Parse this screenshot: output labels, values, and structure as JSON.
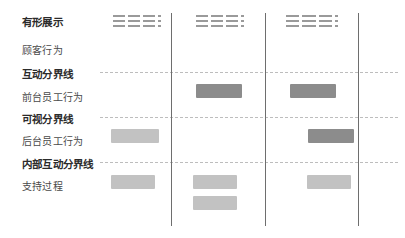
{
  "diagram": {
    "rows": [
      {
        "id": "physical-evidence",
        "label": "有形展示",
        "type": "stage",
        "top": 14
      },
      {
        "id": "customer-action",
        "label": "顾客行为",
        "type": "actor",
        "top": 42
      },
      {
        "id": "interaction-line",
        "label": "互动分界线",
        "type": "stage",
        "top": 66
      },
      {
        "id": "onstage-action",
        "label": "前台员工行为",
        "type": "actor",
        "top": 89
      },
      {
        "id": "visibility-line",
        "label": "可视分界线",
        "type": "stage",
        "top": 111
      },
      {
        "id": "backstage-action",
        "label": "后台员工行为",
        "type": "actor",
        "top": 133
      },
      {
        "id": "internal-line",
        "label": "内部互动分界线",
        "type": "stage",
        "top": 156
      },
      {
        "id": "support-process",
        "label": "支持过程",
        "type": "actor",
        "top": 178
      }
    ],
    "separators": [
      {
        "id": "interaction-divider",
        "y": 72
      },
      {
        "id": "visibility-divider",
        "y": 117
      },
      {
        "id": "internal-divider",
        "y": 162
      }
    ],
    "columns": [
      {
        "id": "column-divider-1",
        "x": 171
      },
      {
        "id": "column-divider-2",
        "x": 265
      },
      {
        "id": "column-divider-3",
        "x": 358
      }
    ],
    "evidence_groups": [
      {
        "id": "evidence-lines-1",
        "x": 113,
        "y": 15,
        "width": 48,
        "rows": 3,
        "segments": [
          13,
          13,
          13,
          3
        ]
      },
      {
        "id": "evidence-lines-2",
        "x": 196,
        "y": 15,
        "width": 48,
        "rows": 3,
        "segments": [
          13,
          13,
          13,
          3
        ]
      },
      {
        "id": "evidence-lines-3",
        "x": 286,
        "y": 15,
        "width": 52,
        "rows": 3,
        "segments": [
          14,
          14,
          14,
          3
        ]
      }
    ],
    "process_boxes": [
      {
        "id": "onstage-box-2",
        "row": "onstage-action",
        "column": 2,
        "shade": "dark",
        "x": 196,
        "y": 84,
        "width": 46,
        "height": 14
      },
      {
        "id": "onstage-box-3",
        "row": "onstage-action",
        "column": 3,
        "shade": "dark",
        "x": 290,
        "y": 84,
        "width": 46,
        "height": 14
      },
      {
        "id": "backstage-box-1",
        "row": "backstage-action",
        "column": 1,
        "shade": "light",
        "x": 111,
        "y": 129,
        "width": 48,
        "height": 14
      },
      {
        "id": "backstage-box-3",
        "row": "backstage-action",
        "column": 3,
        "shade": "dark",
        "x": 308,
        "y": 129,
        "width": 46,
        "height": 14
      },
      {
        "id": "support-box-1",
        "row": "support-process",
        "column": 1,
        "shade": "light",
        "x": 111,
        "y": 175,
        "width": 44,
        "height": 14
      },
      {
        "id": "support-box-2a",
        "row": "support-process",
        "column": 2,
        "shade": "light",
        "x": 193,
        "y": 175,
        "width": 44,
        "height": 14
      },
      {
        "id": "support-box-2b",
        "row": "support-process",
        "column": 2,
        "shade": "light",
        "x": 193,
        "y": 196,
        "width": 44,
        "height": 14
      },
      {
        "id": "support-box-3",
        "row": "support-process",
        "column": 3,
        "shade": "light",
        "x": 307,
        "y": 175,
        "width": 44,
        "height": 14
      }
    ],
    "colors": {
      "background": "#ffffff",
      "box_dark": "#8c8c8c",
      "box_light": "#c2c2c2",
      "divider_dashed": "#bdbdbd",
      "divider_vertical": "#6e6e6e",
      "stage_text": "#2b2b2b",
      "actor_text": "#4a4a4a",
      "evidence_dash": "#9a9a9a"
    }
  }
}
